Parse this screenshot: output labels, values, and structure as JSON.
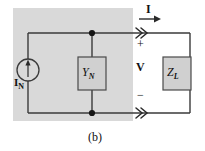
{
  "figure": {
    "caption": "(b)",
    "shaded_region_color": "#d9d9d9",
    "wire_color": "#3a3a3a",
    "component_fill": "#d0d0d0",
    "text_color": "#111111"
  },
  "labels": {
    "current_source": "I",
    "current_source_sub": "N",
    "norton_admittance": "Y",
    "norton_admittance_sub": "N",
    "load_impedance": "Z",
    "load_impedance_sub": "L",
    "terminal_current": "I",
    "terminal_voltage": "V",
    "polarity_positive": "+",
    "polarity_negative": "−"
  },
  "icons": {
    "current_source": "current-source-circle-arrow-icon",
    "node_dot": "junction-node-icon",
    "terminal_arrow": "double-chevron-terminal-icon",
    "current_arrow": "current-direction-arrow-icon"
  }
}
